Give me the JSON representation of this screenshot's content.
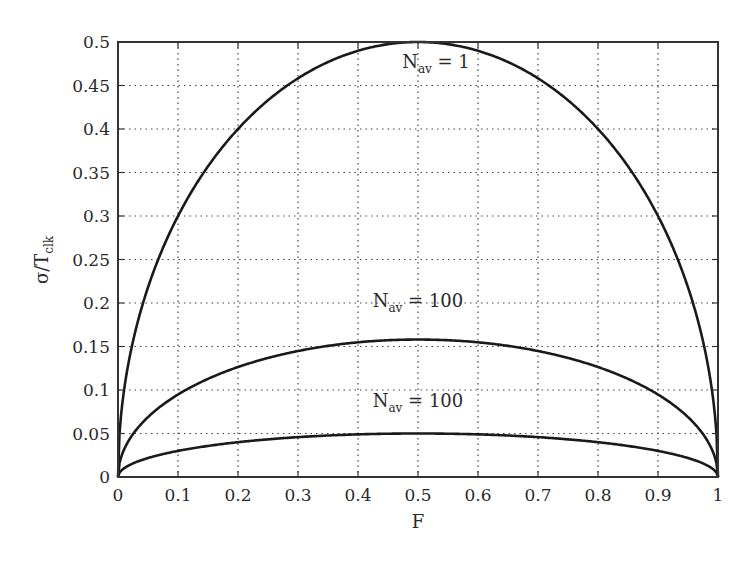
{
  "chart_data": {
    "type": "line",
    "title": "",
    "xlabel": "F",
    "ylabel": "σ/T",
    "ylabel_subscript": "clk",
    "xlim": [
      0,
      1
    ],
    "ylim": [
      0,
      0.5
    ],
    "grid": true,
    "legend": "none",
    "x_ticks": [
      "0",
      "0.1",
      "0.2",
      "0.3",
      "0.4",
      "0.5",
      "0.6",
      "0.7",
      "0.8",
      "0.9",
      "1"
    ],
    "y_ticks": [
      "0",
      "0.05",
      "0.1",
      "0.15",
      "0.2",
      "0.25",
      "0.3",
      "0.35",
      "0.4",
      "0.45",
      "0.5"
    ],
    "x": [
      0,
      0.01,
      0.05,
      0.1,
      0.2,
      0.3,
      0.4,
      0.5,
      0.6,
      0.7,
      0.8,
      0.9,
      0.95,
      0.99,
      1
    ],
    "series": [
      {
        "name": "Nav = 1",
        "values": [
          0,
          0.099,
          0.218,
          0.3,
          0.4,
          0.458,
          0.49,
          0.5,
          0.49,
          0.458,
          0.4,
          0.3,
          0.218,
          0.099,
          0
        ]
      },
      {
        "name": "Nav = 10",
        "values": [
          0,
          0.031,
          0.069,
          0.095,
          0.126,
          0.145,
          0.155,
          0.158,
          0.155,
          0.145,
          0.126,
          0.095,
          0.069,
          0.031,
          0
        ]
      },
      {
        "name": "Nav = 100",
        "values": [
          0,
          0.01,
          0.022,
          0.03,
          0.04,
          0.046,
          0.049,
          0.05,
          0.049,
          0.046,
          0.04,
          0.03,
          0.022,
          0.01,
          0
        ]
      }
    ],
    "annotations": [
      {
        "main": "N",
        "sub": "av",
        "rest": " = 1",
        "x": 0.53,
        "y": 0.47
      },
      {
        "main": "N",
        "sub": "av",
        "rest": " = 100",
        "x": 0.5,
        "y": 0.195
      },
      {
        "main": "N",
        "sub": "av",
        "rest": " = 100",
        "x": 0.5,
        "y": 0.08
      }
    ]
  }
}
